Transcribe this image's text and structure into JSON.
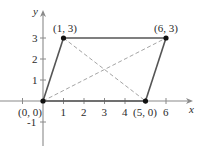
{
  "diagram": {
    "type": "parallelogram-on-coordinate-plane",
    "axes": {
      "x_label": "x",
      "y_label": "y",
      "x_ticks": [
        "1",
        "2",
        "3",
        "4",
        "6"
      ],
      "x_tick_values": [
        -1,
        1,
        2,
        3,
        4,
        5,
        6
      ],
      "y_ticks": [
        "1",
        "2",
        "3",
        "-1"
      ],
      "y_tick_values": [
        -1,
        1,
        2,
        3
      ]
    },
    "points": [
      {
        "label": "(0, 0)",
        "x": 0,
        "y": 0
      },
      {
        "label": "(1, 3)",
        "x": 1,
        "y": 3
      },
      {
        "label": "(6, 3)",
        "x": 6,
        "y": 3
      },
      {
        "label": "(5, 0)",
        "x": 5,
        "y": 0
      }
    ],
    "sides": [
      {
        "from": "(0, 0)",
        "to": "(1, 3)",
        "style": "solid"
      },
      {
        "from": "(1, 3)",
        "to": "(6, 3)",
        "style": "solid"
      },
      {
        "from": "(6, 3)",
        "to": "(5, 0)",
        "style": "solid"
      },
      {
        "from": "(5, 0)",
        "to": "(0, 0)",
        "style": "solid"
      }
    ],
    "diagonals": [
      {
        "from": "(0, 0)",
        "to": "(6, 3)",
        "style": "dashed"
      },
      {
        "from": "(1, 3)",
        "to": "(5, 0)",
        "style": "dashed"
      }
    ],
    "colors": {
      "axis": "#8a8a8a",
      "side": "#555555",
      "diagonal": "#9a9a9a",
      "point": "#111111",
      "text": "#2a2a2a"
    }
  }
}
